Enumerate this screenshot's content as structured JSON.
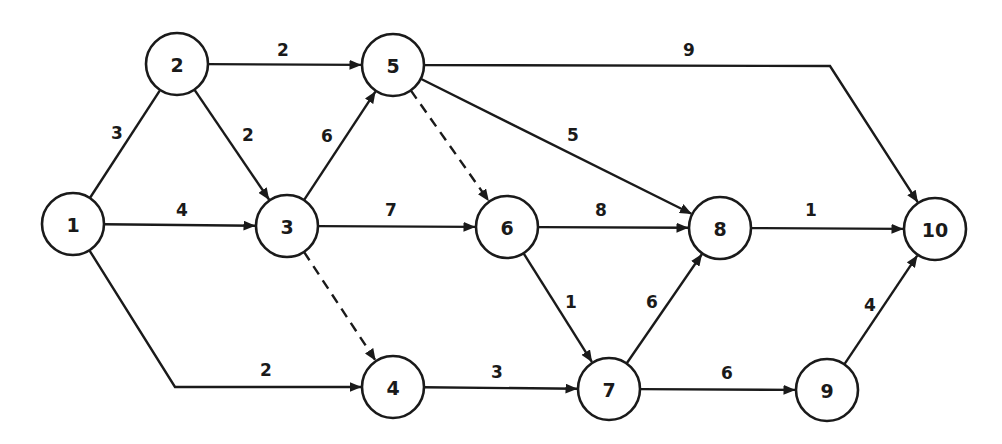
{
  "diagram": {
    "type": "activity-network",
    "colors": {
      "stroke": "#1a1a1a",
      "background": "#ffffff"
    },
    "node_radius": 31,
    "nodes": [
      {
        "id": "1",
        "label": "1",
        "x": 73,
        "y": 224
      },
      {
        "id": "2",
        "label": "2",
        "x": 177,
        "y": 64
      },
      {
        "id": "3",
        "label": "3",
        "x": 287,
        "y": 226
      },
      {
        "id": "4",
        "label": "4",
        "x": 393,
        "y": 387
      },
      {
        "id": "5",
        "label": "5",
        "x": 393,
        "y": 65
      },
      {
        "id": "6",
        "label": "6",
        "x": 507,
        "y": 227
      },
      {
        "id": "7",
        "label": "7",
        "x": 609,
        "y": 389
      },
      {
        "id": "8",
        "label": "8",
        "x": 720,
        "y": 228
      },
      {
        "id": "9",
        "label": "9",
        "x": 827,
        "y": 390
      },
      {
        "id": "10",
        "label": "10",
        "x": 935,
        "y": 229
      }
    ],
    "edges": [
      {
        "from": "1",
        "to": "2",
        "weight": "3",
        "style": "solid",
        "arrow": false,
        "label_x": 117,
        "label_y": 133
      },
      {
        "from": "1",
        "to": "3",
        "weight": "4",
        "style": "solid",
        "arrow": true,
        "label_x": 182,
        "label_y": 210
      },
      {
        "from": "1",
        "to": "4",
        "weight": "2",
        "style": "solid",
        "arrow": true,
        "via": [
          [
            175,
            387
          ]
        ],
        "label_x": 266,
        "label_y": 370
      },
      {
        "from": "2",
        "to": "5",
        "weight": "2",
        "style": "solid",
        "arrow": true,
        "label_x": 283,
        "label_y": 50
      },
      {
        "from": "2",
        "to": "3",
        "weight": "2",
        "style": "solid",
        "arrow": true,
        "label_x": 248,
        "label_y": 135
      },
      {
        "from": "3",
        "to": "5",
        "weight": "6",
        "style": "solid",
        "arrow": true,
        "label_x": 327,
        "label_y": 136
      },
      {
        "from": "3",
        "to": "6",
        "weight": "7",
        "style": "solid",
        "arrow": true,
        "label_x": 391,
        "label_y": 210
      },
      {
        "from": "3",
        "to": "4",
        "weight": "",
        "style": "dashed",
        "arrow": true,
        "label_x": 0,
        "label_y": 0
      },
      {
        "from": "5",
        "to": "6",
        "weight": "",
        "style": "dashed",
        "arrow": true,
        "label_x": 0,
        "label_y": 0
      },
      {
        "from": "5",
        "to": "8",
        "weight": "5",
        "style": "solid",
        "arrow": true,
        "label_x": 573,
        "label_y": 135
      },
      {
        "from": "5",
        "to": "10",
        "weight": "9",
        "style": "solid",
        "arrow": true,
        "via": [
          [
            830,
            66
          ]
        ],
        "label_x": 689,
        "label_y": 50
      },
      {
        "from": "6",
        "to": "8",
        "weight": "8",
        "style": "solid",
        "arrow": true,
        "label_x": 601,
        "label_y": 210
      },
      {
        "from": "6",
        "to": "7",
        "weight": "1",
        "style": "solid",
        "arrow": true,
        "label_x": 571,
        "label_y": 302
      },
      {
        "from": "4",
        "to": "7",
        "weight": "3",
        "style": "solid",
        "arrow": true,
        "label_x": 497,
        "label_y": 372
      },
      {
        "from": "7",
        "to": "8",
        "weight": "6",
        "style": "solid",
        "arrow": true,
        "label_x": 652,
        "label_y": 302
      },
      {
        "from": "7",
        "to": "9",
        "weight": "6",
        "style": "solid",
        "arrow": true,
        "label_x": 727,
        "label_y": 373
      },
      {
        "from": "8",
        "to": "10",
        "weight": "1",
        "style": "solid",
        "arrow": true,
        "label_x": 811,
        "label_y": 210
      },
      {
        "from": "9",
        "to": "10",
        "weight": "4",
        "style": "solid",
        "arrow": true,
        "label_x": 870,
        "label_y": 305
      }
    ]
  }
}
